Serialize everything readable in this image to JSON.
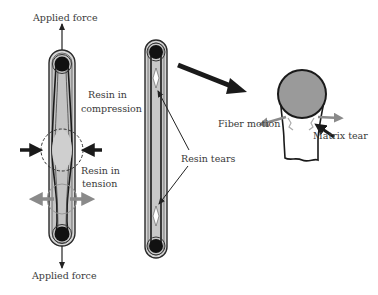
{
  "labels": {
    "applied_force_top": "Applied force",
    "applied_force_bottom": "Applied force",
    "resin_compression_line1": "Resin in",
    "resin_compression_line2": "compression",
    "resin_tension_line1": "Resin in",
    "resin_tension_line2": "tension",
    "resin_tears": "Resin tears",
    "fiber_motion": "Fiber motion",
    "matrix_tear": "Matrix tear"
  },
  "colors": {
    "strap_fill": "#c8c8c8",
    "strap_outline": "#2a2a2a",
    "pin": "#111111",
    "compression_arrow": "#1a1a1a",
    "tension_arrow": "#8a8a8a",
    "fiber_circle": "#9a9a9a",
    "text": "#3a3a3a"
  }
}
